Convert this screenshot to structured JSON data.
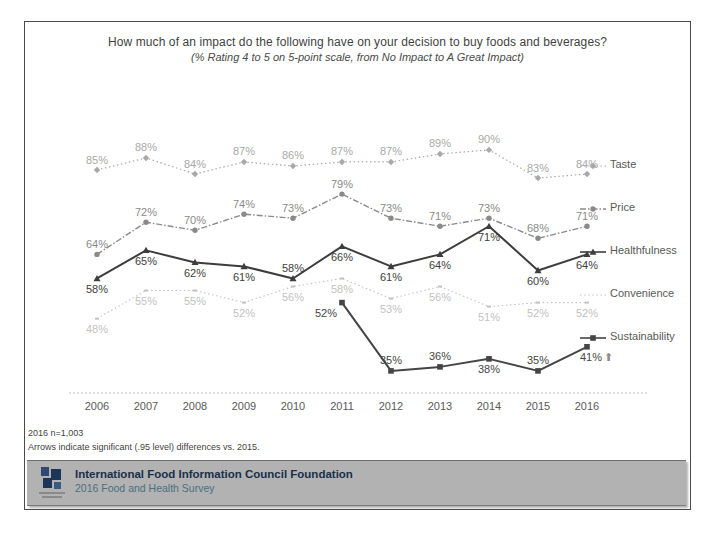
{
  "chart_data": {
    "type": "line",
    "title": "How much of an impact do the following have on your decision to buy foods and beverages?",
    "subtitle": "(% Rating 4 to 5 on 5-point scale, from No Impact to A Great Impact)",
    "categories": [
      "2006",
      "2007",
      "2008",
      "2009",
      "2010",
      "2011",
      "2012",
      "2013",
      "2014",
      "2015",
      "2016"
    ],
    "ylim": [
      30,
      95
    ],
    "grid": false,
    "legend_position": "right",
    "axis_color": "#bfbfbf",
    "tick_label_color": "#595959",
    "series": [
      {
        "name": "Taste",
        "color": "#a8a8a8",
        "line": "dotted",
        "marker": "diamond",
        "width": 1.2,
        "values": [
          85,
          88,
          84,
          87,
          86,
          87,
          87,
          89,
          90,
          83,
          84
        ],
        "label_default": "above"
      },
      {
        "name": "Price",
        "color": "#8a8a8a",
        "line": "dashdot",
        "marker": "circle",
        "width": 1.4,
        "values": [
          64,
          72,
          70,
          74,
          73,
          79,
          73,
          71,
          73,
          68,
          71
        ],
        "label_default": "above"
      },
      {
        "name": "Healthfulness",
        "color": "#3d3d3d",
        "line": "solid",
        "marker": "triangle",
        "width": 2,
        "values": [
          58,
          65,
          62,
          61,
          58,
          66,
          61,
          64,
          71,
          60,
          64
        ],
        "label_default": "below",
        "label_side": [
          "below",
          "below",
          "below",
          "below",
          "above",
          "below",
          "below",
          "below",
          "below",
          "below",
          "below"
        ]
      },
      {
        "name": "Convenience",
        "color": "#c2c2c2",
        "line": "dotted",
        "marker": "dash",
        "width": 1.1,
        "values": [
          48,
          55,
          55,
          52,
          56,
          58,
          53,
          56,
          51,
          52,
          52
        ],
        "label_default": "below"
      },
      {
        "name": "Sustainability",
        "color": "#454545",
        "line": "solid",
        "marker": "square",
        "width": 2,
        "values": [
          null,
          null,
          null,
          null,
          null,
          52,
          35,
          36,
          38,
          35,
          41
        ],
        "label_default": "above",
        "label_side": [
          null,
          null,
          null,
          null,
          null,
          "below",
          "above",
          "above",
          "below",
          "above",
          "below"
        ],
        "label_dx": [
          0,
          0,
          0,
          0,
          0,
          -16,
          0,
          0,
          0,
          0,
          4
        ],
        "end_arrow": "⬆",
        "end_arrow_color": "#8c8c8c"
      }
    ]
  },
  "slide": {
    "footnote_line1": "2016 n=1,003",
    "footnote_line2": "Arrows indicate significant (.95 level) differences vs. 2015.",
    "footer": {
      "org": "International Food Information Council Foundation",
      "survey": "2016 Food and Health Survey"
    }
  }
}
